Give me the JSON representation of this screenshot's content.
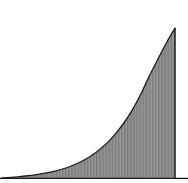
{
  "chart_data": {
    "type": "area",
    "title": "",
    "subtitle": "",
    "xlabel": "",
    "ylabel": "",
    "grid": false,
    "legend": null,
    "legend_position": "none",
    "xlim": [
      0,
      1
    ],
    "ylim": [
      0,
      1
    ],
    "baseline_y": 0,
    "fill_color": "#8c8c8c",
    "line_color": "#1a1a1a",
    "hatch_pattern": "vertical-lines",
    "hatch_color": "#5a5a5a",
    "x": [
      0,
      0.05,
      0.1,
      0.15,
      0.2,
      0.25,
      0.3,
      0.35,
      0.4,
      0.45,
      0.5,
      0.55,
      0.6,
      0.65,
      0.7,
      0.75,
      0.8,
      0.85,
      0.9,
      0.95,
      1
    ],
    "values": [
      0,
      0.004,
      0.009,
      0.015,
      0.022,
      0.032,
      0.044,
      0.06,
      0.08,
      0.105,
      0.137,
      0.177,
      0.226,
      0.286,
      0.36,
      0.448,
      0.553,
      0.676,
      0.79,
      0.9,
      1.0
    ],
    "series": [
      {
        "name": "curve",
        "values": [
          0,
          0.004,
          0.009,
          0.015,
          0.022,
          0.032,
          0.044,
          0.06,
          0.08,
          0.105,
          0.137,
          0.177,
          0.226,
          0.286,
          0.36,
          0.448,
          0.553,
          0.676,
          0.79,
          0.9,
          1.0
        ]
      }
    ],
    "annotations": []
  },
  "figure": {
    "background_color": "#ffffff",
    "plot_left_px": 2,
    "plot_right_px": 175,
    "plot_top_px": 28,
    "plot_bottom_px": 178,
    "axis_line_color": "#1a1a1a"
  }
}
